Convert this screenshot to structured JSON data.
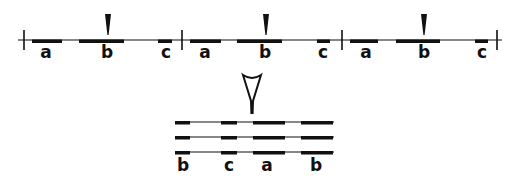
{
  "diagram": {
    "colors": {
      "ink": "#111111",
      "background": "#ffffff"
    },
    "top_sequence": {
      "line": {
        "x1": 18,
        "x2": 502,
        "y": 40
      },
      "boundary_ticks": [
        24,
        182,
        342,
        497
      ],
      "units": [
        {
          "segments": [
            {
              "label": "a",
              "x1": 32,
              "x2": 62,
              "label_x": 46
            },
            {
              "label": "b",
              "x1": 79,
              "x2": 124,
              "label_x": 107
            },
            {
              "label": "c",
              "x1": 158,
              "x2": 172,
              "label_x": 166
            }
          ],
          "pointer_x": 108
        },
        {
          "segments": [
            {
              "label": "a",
              "x1": 190,
              "x2": 221,
              "label_x": 205
            },
            {
              "label": "b",
              "x1": 237,
              "x2": 282,
              "label_x": 265
            },
            {
              "label": "c",
              "x1": 317,
              "x2": 330,
              "label_x": 323
            }
          ],
          "pointer_x": 266
        },
        {
          "segments": [
            {
              "label": "a",
              "x1": 350,
              "x2": 378,
              "label_x": 366
            },
            {
              "label": "b",
              "x1": 396,
              "x2": 440,
              "label_x": 424
            },
            {
              "label": "c",
              "x1": 475,
              "x2": 488,
              "label_x": 482
            }
          ],
          "pointer_x": 424
        }
      ]
    },
    "open_arrow": {
      "x": 252,
      "y_top": 75,
      "y_tip": 113
    },
    "bottom_stack": {
      "line_x1": 175,
      "line_x2": 334,
      "rows_y": [
        122,
        137,
        152
      ],
      "segments": [
        {
          "label": "b",
          "x1": 175,
          "x2": 190,
          "label_x": 183
        },
        {
          "label": "c",
          "x1": 221,
          "x2": 237,
          "label_x": 229
        },
        {
          "label": "a",
          "x1": 253,
          "x2": 285,
          "label_x": 267
        },
        {
          "label": "b",
          "x1": 301,
          "x2": 333,
          "label_x": 316
        }
      ],
      "labels_y": 171
    },
    "labels": {
      "top": [
        "a",
        "b",
        "c",
        "a",
        "b",
        "c",
        "a",
        "b",
        "c"
      ],
      "bottom": [
        "b",
        "c",
        "a",
        "b"
      ]
    }
  }
}
